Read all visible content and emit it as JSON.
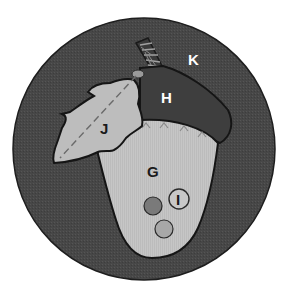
{
  "diagram": {
    "type": "labeled acorn illustration",
    "background": "#ffffff",
    "colors": {
      "outer_circle": "#4a4a4a",
      "cap": "#3f3f3f",
      "nut": "#c4c4c4",
      "leaf": "#bdbdbd",
      "outline": "#1a1a1a",
      "dark_dot": "#7a7a7a",
      "light_dot": "#a8a8a8",
      "label_light": "#ffffff",
      "label_dark": "#1a1a1a"
    },
    "labels": {
      "K": "K",
      "H": "H",
      "J": "J",
      "G": "G",
      "I": "I"
    },
    "parts": [
      {
        "label": "K",
        "region": "outer dark circle background"
      },
      {
        "label": "H",
        "region": "acorn cap"
      },
      {
        "label": "J",
        "region": "leaf"
      },
      {
        "label": "G",
        "region": "acorn nut body"
      },
      {
        "label": "I",
        "region": "small circle inside nut"
      }
    ]
  }
}
